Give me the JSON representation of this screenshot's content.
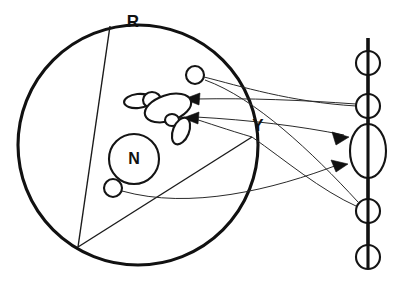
{
  "figure": {
    "background_color": "#ffffff",
    "ink_color": "#111111",
    "width": 403,
    "height": 284
  },
  "labels": [
    {
      "id": "outer-body",
      "text": "R",
      "x": 133,
      "y": 27,
      "role": "outer-sphere-label"
    },
    {
      "id": "edge-point",
      "text": "Y",
      "x": 258,
      "y": 131,
      "role": "edge-point-label"
    },
    {
      "id": "nucleus",
      "text": "N",
      "x": 134,
      "y": 164,
      "role": "nucleus-label"
    }
  ],
  "shapes": {
    "outer_circle": {
      "cx": 138,
      "cy": 145,
      "r": 120,
      "stroke_width": 3.1
    },
    "nucleus_circle": {
      "cx": 134,
      "cy": 159,
      "r": 25,
      "stroke_width": 2.1
    },
    "particles": [
      {
        "id": "particle-upper",
        "cx": 195,
        "cy": 75,
        "r": 9
      },
      {
        "id": "particle-lower",
        "cx": 113,
        "cy": 188,
        "r": 9
      }
    ],
    "organelle_cluster": [
      {
        "id": "organelle-body-main",
        "cx": 168,
        "cy": 108,
        "rx": 24,
        "ry": 13,
        "rotation": -18
      },
      {
        "id": "organelle-body-left",
        "cx": 138,
        "cy": 101,
        "rx": 14,
        "ry": 7,
        "rotation": -6
      },
      {
        "id": "organelle-lobe-upper",
        "cx": 152,
        "cy": 99,
        "rx": 9,
        "ry": 8,
        "rotation": 0
      },
      {
        "id": "organelle-lobe-lower",
        "cx": 181,
        "cy": 131,
        "rx": 8,
        "ry": 14,
        "rotation": 22
      },
      {
        "id": "organelle-node-small",
        "cx": 172,
        "cy": 120,
        "rx": 7,
        "ry": 6,
        "rotation": 0
      }
    ]
  },
  "image_plane": {
    "id": "vertical-image-plane",
    "x": 368,
    "y_top": 38,
    "y_bottom": 268,
    "stroke_width": 3.1,
    "nodes": [
      {
        "id": "plane-node-1",
        "cx": 368,
        "cy": 63,
        "r": 12
      },
      {
        "id": "plane-node-2",
        "cx": 368,
        "cy": 106,
        "r": 12
      },
      {
        "id": "plane-lens",
        "cx": 368,
        "cy": 151,
        "rx": 18,
        "ry": 27
      },
      {
        "id": "plane-node-3",
        "cx": 368,
        "cy": 211,
        "r": 12
      },
      {
        "id": "plane-node-4",
        "cx": 368,
        "cy": 257,
        "r": 12
      }
    ]
  },
  "chords": [
    {
      "id": "chord-top-to-lower-left",
      "x1": 110,
      "y1": 26,
      "x2": 78,
      "y2": 247
    },
    {
      "id": "chord-lower-left-to-edge",
      "x1": 78,
      "y1": 247,
      "x2": 252,
      "y2": 137
    }
  ],
  "rays": [
    {
      "id": "ray-upper-particle-to-plane-node-2",
      "from": "particle-upper",
      "to": "plane-node-2",
      "path": "M 204 77 C 240 86, 290 102, 356 106",
      "style": "thin-curve"
    },
    {
      "id": "ray-plane-node-2-to-organelle",
      "from": "plane-node-2",
      "to": "organelle-body-main",
      "path": "M 356 104 C 300 100, 250 98, 192 99",
      "style": "thin-curve",
      "arrow_at": {
        "x": 187,
        "y": 99,
        "angle": 186
      }
    },
    {
      "id": "ray-organelle-to-plane-lens-upper",
      "from": "organelle-cluster",
      "to": "plane-lens",
      "path": "M 196 117 C 250 120, 300 126, 342 134",
      "style": "thin-curve",
      "arrow_at": {
        "x": 347,
        "y": 136,
        "angle": 12
      }
    },
    {
      "id": "ray-edge-down-to-organelle",
      "from": "edge-point-Y",
      "to": "organelle-lobe-lower",
      "path": "M 252 137 C 228 130, 208 123, 190 118",
      "style": "thin-curve",
      "arrow_at": {
        "x": 186,
        "y": 117,
        "angle": 196
      }
    },
    {
      "id": "ray-lower-particle-to-plane-lens-lower",
      "from": "particle-lower",
      "to": "plane-lens",
      "path": "M 122 191 C 190 208, 270 190, 338 165",
      "style": "thin-curve",
      "arrow_at": {
        "x": 344,
        "y": 162,
        "angle": -22
      }
    },
    {
      "id": "ray-plane-node-3-to-edge",
      "from": "plane-node-3",
      "to": "edge-point-Y",
      "path": "M 358 207 C 320 190, 285 160, 254 138",
      "style": "thin-curve"
    },
    {
      "id": "ray-upper-long-curve-to-plane-node-3",
      "from": "particle-upper",
      "to": "plane-node-3",
      "path": "M 205 80 C 255 98, 310 150, 358 202",
      "style": "thin-curve"
    }
  ]
}
